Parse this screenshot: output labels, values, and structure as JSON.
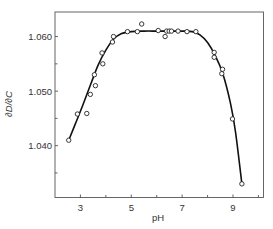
{
  "chart_data": {
    "type": "scatter",
    "title": "",
    "xlabel": "pH",
    "ylabel": "∂D/∂C",
    "xlim": [
      2.0,
      10.2
    ],
    "ylim": [
      1.0305,
      1.0645
    ],
    "x_ticks_major": [
      3,
      5,
      7,
      9
    ],
    "x_ticks_minor": [
      4,
      6,
      8,
      10
    ],
    "x_tick_labels": [
      "3",
      "5",
      "7",
      "9"
    ],
    "y_ticks_major": [
      1.04,
      1.05,
      1.06
    ],
    "y_ticks_minor": [
      1.035,
      1.045,
      1.055
    ],
    "y_tick_labels": [
      "1.040",
      "1.050",
      "1.060"
    ],
    "grid": false,
    "legend": null,
    "series": [
      {
        "name": "measured",
        "marker": "open-circle",
        "points": [
          [
            2.54,
            1.041
          ],
          [
            2.88,
            1.0458
          ],
          [
            3.25,
            1.0459
          ],
          [
            3.39,
            1.0494
          ],
          [
            3.59,
            1.051
          ],
          [
            3.55,
            1.053
          ],
          [
            3.88,
            1.055
          ],
          [
            3.85,
            1.057
          ],
          [
            4.26,
            1.059
          ],
          [
            4.3,
            1.06
          ],
          [
            4.85,
            1.0609
          ],
          [
            5.24,
            1.0609
          ],
          [
            5.41,
            1.0623
          ],
          [
            6.06,
            1.0611
          ],
          [
            6.33,
            1.06
          ],
          [
            6.39,
            1.061
          ],
          [
            6.49,
            1.061
          ],
          [
            6.58,
            1.061
          ],
          [
            6.84,
            1.061
          ],
          [
            7.19,
            1.0609
          ],
          [
            7.54,
            1.0609
          ],
          [
            8.26,
            1.0571
          ],
          [
            8.26,
            1.0562
          ],
          [
            8.59,
            1.054
          ],
          [
            8.56,
            1.0532
          ],
          [
            8.98,
            1.0449
          ],
          [
            9.35,
            1.033
          ]
        ]
      },
      {
        "name": "fitted curve",
        "marker": "line",
        "points": [
          [
            2.54,
            1.041
          ],
          [
            2.8,
            1.044
          ],
          [
            3.1,
            1.0475
          ],
          [
            3.4,
            1.0512
          ],
          [
            3.7,
            1.0548
          ],
          [
            4.0,
            1.0575
          ],
          [
            4.3,
            1.0595
          ],
          [
            4.6,
            1.0605
          ],
          [
            5.0,
            1.0609
          ],
          [
            5.5,
            1.061
          ],
          [
            6.0,
            1.061
          ],
          [
            6.5,
            1.061
          ],
          [
            7.0,
            1.061
          ],
          [
            7.4,
            1.0609
          ],
          [
            7.7,
            1.0603
          ],
          [
            8.0,
            1.0589
          ],
          [
            8.3,
            1.0565
          ],
          [
            8.6,
            1.0532
          ],
          [
            8.9,
            1.0478
          ],
          [
            9.1,
            1.0425
          ],
          [
            9.35,
            1.033
          ]
        ]
      }
    ]
  }
}
